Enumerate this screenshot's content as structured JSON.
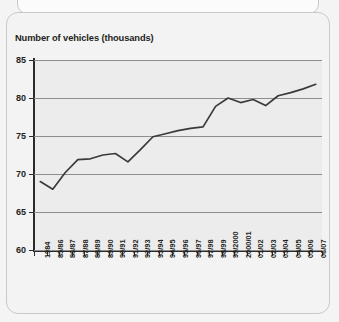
{
  "page": {
    "background_color": "#f4f4f4",
    "card_border_color": "#c9c9c9"
  },
  "chart_data": {
    "type": "line",
    "title": "Number of vehicles (thousands)",
    "xlabel": "",
    "ylabel": "Number of vehicles (thousands)",
    "ylim": [
      60,
      85
    ],
    "yticks": [
      60,
      65,
      70,
      75,
      80,
      85
    ],
    "grid": true,
    "legend": null,
    "line_color": "#3a3a3a",
    "plot_background": "#ececec",
    "categories": [
      "1984",
      "85/86",
      "86/87",
      "87/88",
      "88/89",
      "89/90",
      "90/91",
      "91/92",
      "92/93",
      "93/94",
      "94/95",
      "95/96",
      "96/97",
      "97/98",
      "98/99",
      "99/2000",
      "2000/01",
      "01/02",
      "02/03",
      "03/04",
      "04/05",
      "05/06",
      "06/07"
    ],
    "values": [
      69.0,
      68.0,
      70.2,
      71.9,
      72.0,
      72.5,
      72.7,
      71.6,
      73.2,
      74.9,
      75.3,
      75.7,
      76.0,
      76.2,
      78.9,
      80.0,
      79.4,
      79.8,
      79.0,
      80.3,
      80.7,
      81.2,
      81.8
    ]
  }
}
